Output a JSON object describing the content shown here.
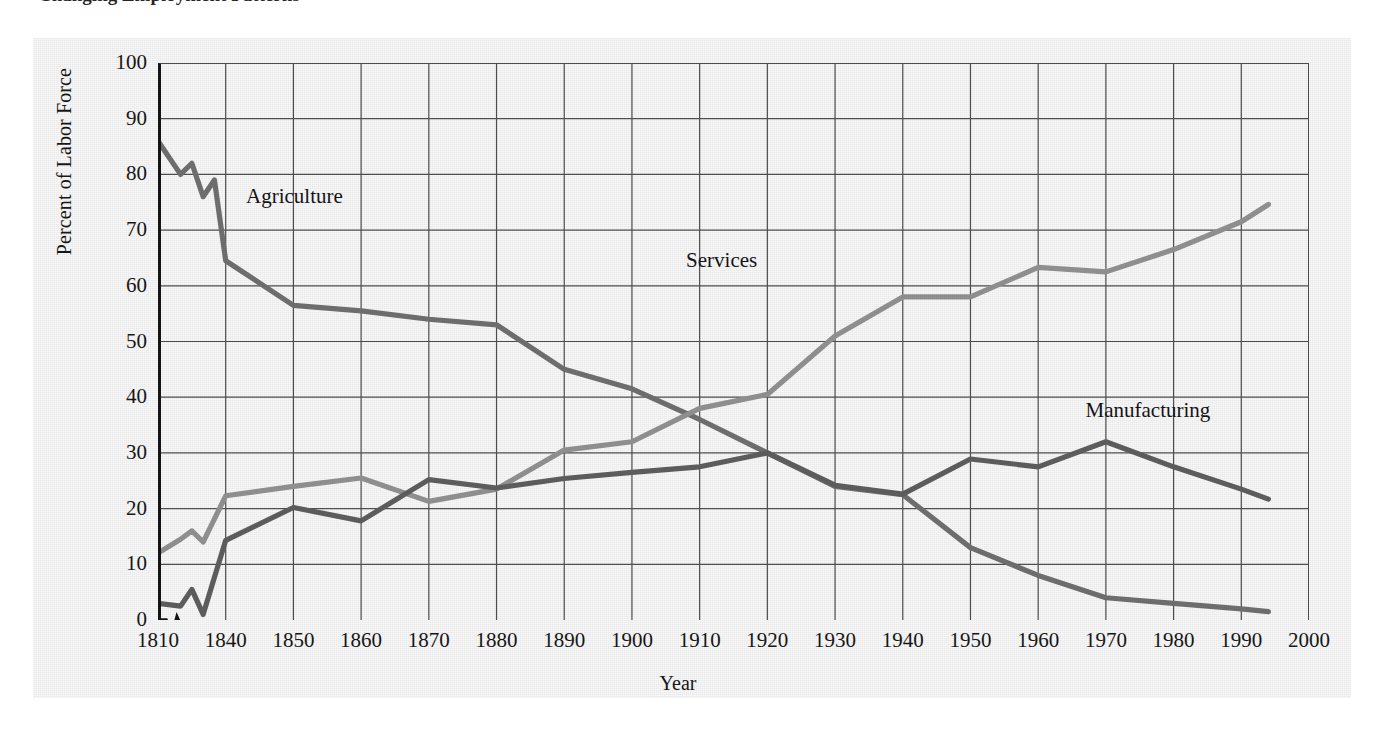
{
  "caption": {
    "text": "Changing Employment Patterns"
  },
  "chart_data": {
    "type": "line",
    "title": "",
    "xlabel": "Year",
    "ylabel": "Percent of Labor Force",
    "xlim": [
      1810,
      2000
    ],
    "ylim": [
      0,
      100
    ],
    "grid": true,
    "axis_break_after": 1810,
    "legend_position": "inline-labels",
    "x_tick_labels": [
      "1810",
      "1840",
      "1850",
      "1860",
      "1870",
      "1880",
      "1890",
      "1900",
      "1910",
      "1920",
      "1930",
      "1940",
      "1950",
      "1960",
      "1970",
      "1980",
      "1990",
      "2000"
    ],
    "x_tick_values": [
      1810,
      1840,
      1850,
      1860,
      1870,
      1880,
      1890,
      1900,
      1910,
      1920,
      1930,
      1940,
      1950,
      1960,
      1970,
      1980,
      1990,
      2000
    ],
    "y_tick_labels": [
      "0",
      "10",
      "20",
      "30",
      "40",
      "50",
      "60",
      "70",
      "80",
      "90",
      "100"
    ],
    "y_tick_values": [
      0,
      10,
      20,
      30,
      40,
      50,
      60,
      70,
      80,
      90,
      100
    ],
    "series": [
      {
        "name": "Agriculture",
        "color": "#6d6d6d",
        "label_x": 1843,
        "label_y": 76,
        "x": [
          1810,
          1820,
          1825,
          1830,
          1835,
          1840,
          1850,
          1860,
          1870,
          1880,
          1890,
          1900,
          1910,
          1920,
          1930,
          1940,
          1950,
          1960,
          1970,
          1980,
          1990,
          1994
        ],
        "values": [
          86,
          80,
          82,
          76,
          79,
          64.5,
          56.5,
          55.5,
          54,
          53,
          45,
          41.5,
          36,
          30,
          24,
          22.5,
          13,
          8,
          4,
          3,
          2,
          1.5
        ]
      },
      {
        "name": "Services",
        "color": "#8e8e8e",
        "label_x": 1908,
        "label_y": 64.5,
        "x": [
          1810,
          1820,
          1825,
          1830,
          1840,
          1850,
          1860,
          1870,
          1880,
          1890,
          1900,
          1910,
          1920,
          1930,
          1940,
          1950,
          1960,
          1970,
          1980,
          1990,
          1994
        ],
        "values": [
          12,
          14.5,
          16,
          14,
          22.3,
          24,
          25.5,
          21.3,
          23.5,
          30.5,
          32,
          38,
          40.5,
          51,
          58,
          58,
          63.3,
          62.5,
          66.5,
          71.5,
          74.6
        ]
      },
      {
        "name": "Manufacturing",
        "color": "#5c5c5c",
        "label_x": 1967,
        "label_y": 37.5,
        "x": [
          1810,
          1820,
          1825,
          1830,
          1840,
          1850,
          1860,
          1870,
          1880,
          1890,
          1900,
          1910,
          1920,
          1930,
          1940,
          1950,
          1960,
          1970,
          1980,
          1990,
          1994
        ],
        "values": [
          3,
          2.5,
          5.5,
          1,
          14.3,
          20.2,
          17.8,
          25.2,
          23.7,
          25.4,
          26.5,
          27.5,
          30,
          24.2,
          22.6,
          28.9,
          27.5,
          32,
          27.5,
          23.5,
          21.7
        ]
      }
    ]
  }
}
